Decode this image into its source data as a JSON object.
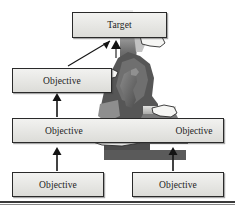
{
  "diagram": {
    "title_node": {
      "label": "Target"
    },
    "nodes": [
      {
        "id": "target",
        "label": "Target",
        "level": 0
      },
      {
        "id": "obj_l2",
        "label": "Objective",
        "level": 1
      },
      {
        "id": "obj_mid",
        "label": "Objective",
        "level": 2
      },
      {
        "id": "obj_mid_right",
        "label": "Objective",
        "level": 2
      },
      {
        "id": "obj_bl",
        "label": "Objective",
        "level": 3
      },
      {
        "id": "obj_br",
        "label": "Objective",
        "level": 3
      }
    ],
    "connections": [
      {
        "from": "obj_l2",
        "to": "target",
        "style": "diagonal-arrow"
      },
      {
        "from": "obj_mid",
        "to": "target",
        "style": "diagonal-arrow"
      },
      {
        "from": "obj_mid",
        "to": "obj_l2",
        "style": "vertical-arrow"
      },
      {
        "from": "obj_bl",
        "to": "obj_mid",
        "style": "vertical-arrow"
      },
      {
        "from": "obj_br",
        "to": "obj_mid_right",
        "style": "vertical-arrow"
      }
    ],
    "illustration": {
      "name": "person-climbing-stairs-photo",
      "description": "Grayscale photograph of a figure ascending stone steps",
      "hands": [
        {
          "name": "pointing-hand-upper-left"
        },
        {
          "name": "pointing-hand-upper-right"
        },
        {
          "name": "pointing-hand-lower-center"
        },
        {
          "name": "pointing-hand-right"
        }
      ]
    },
    "colors": {
      "box_fill_top": "#f2f2f0",
      "box_fill_bottom": "#dcdcd8",
      "box_border": "#2a2a2a",
      "text": "#1c1c1c",
      "arrow": "#1a1a1a",
      "rule": "#3a3a3a",
      "photo_dark": "#4a4a4a",
      "photo_mid": "#7d7d7d",
      "photo_light": "#c9c9c9"
    }
  }
}
